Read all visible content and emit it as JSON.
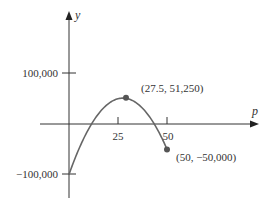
{
  "chart_data": {
    "type": "line",
    "title": "",
    "xlabel": "p",
    "ylabel": "y",
    "function": "y = -200p^2 + 11000p - 100000",
    "x": [
      0,
      5,
      10,
      15,
      20,
      25,
      27.5,
      30,
      35,
      40,
      45,
      50
    ],
    "series": [
      {
        "name": "curve",
        "values": [
          -100000,
          -50000,
          -10000,
          20000,
          40000,
          50000,
          51250,
          50000,
          40000,
          20000,
          -10000,
          -50000
        ]
      }
    ],
    "xlim": [
      0,
      50
    ],
    "ylim": [
      -100000,
      100000
    ],
    "x_ticks": [
      25,
      50
    ],
    "y_ticks": [
      100000,
      -100000
    ],
    "grid": false,
    "annotations": [
      {
        "point": [
          27.5,
          51250
        ],
        "label": "(27.5,  51,250)"
      },
      {
        "point": [
          50,
          -50000
        ],
        "label": "(50,  −50,000)"
      }
    ]
  },
  "axes": {
    "x_label": "p",
    "y_label": "y",
    "x_tick_labels": [
      "25",
      "50"
    ],
    "y_tick_labels": [
      "100,000",
      "−100,000"
    ]
  },
  "annotations": {
    "max_label": "(27.5,  51,250)",
    "end_label": "(50,  −50,000)"
  },
  "colors": {
    "axis": "#333333",
    "curve": "#666666",
    "point": "#555555"
  }
}
